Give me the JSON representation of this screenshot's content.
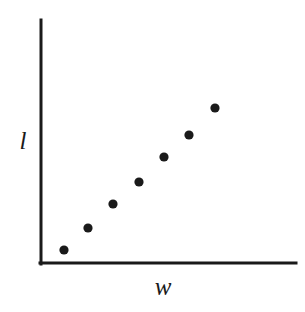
{
  "figure": {
    "background_color": "#ffffff",
    "ink_color": "#1a1a1a",
    "width": 305,
    "height": 312
  },
  "axes": {
    "y_axis": {
      "label": "l",
      "x": 41,
      "y_top": 20,
      "y_bottom": 264,
      "line_width": 3
    },
    "x_axis": {
      "label": "w",
      "y": 263,
      "x_left": 40,
      "x_right": 296,
      "line_width": 3
    }
  },
  "chart_data": {
    "type": "scatter",
    "title": "",
    "xlabel": "w",
    "ylabel": "l",
    "grid": false,
    "legend": null,
    "marker": {
      "shape": "circle",
      "radius": 4.6,
      "color": "#1a1a1a"
    },
    "axis_ticks": {
      "x": [],
      "y": []
    },
    "xlim": [
      0,
      1
    ],
    "ylim": [
      0,
      1
    ],
    "note": "Positive, roughly linear association between w and l; no tick labels or numeric scale are printed on the axes.",
    "points_px": [
      {
        "x": 64,
        "y": 250
      },
      {
        "x": 88,
        "y": 228
      },
      {
        "x": 113,
        "y": 204
      },
      {
        "x": 139,
        "y": 182
      },
      {
        "x": 164,
        "y": 157
      },
      {
        "x": 189,
        "y": 135
      },
      {
        "x": 215,
        "y": 108
      }
    ],
    "x": [
      0.094,
      0.188,
      0.285,
      0.387,
      0.484,
      0.582,
      0.684
    ],
    "y": [
      0.057,
      0.148,
      0.246,
      0.336,
      0.438,
      0.529,
      0.639
    ]
  }
}
